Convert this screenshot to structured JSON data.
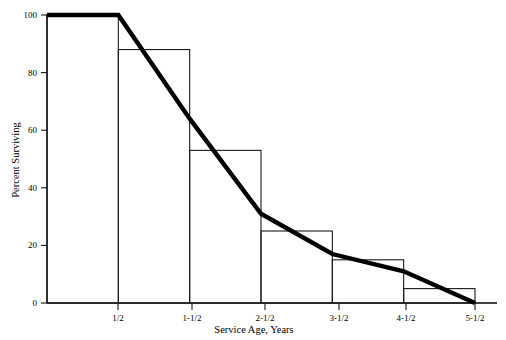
{
  "chart_data": {
    "type": "bar",
    "title": "",
    "subtitle": "",
    "xlabel": "Service Age, Years",
    "ylabel": "Percent Surviving",
    "categories": [
      "1/2",
      "1-1/2",
      "2-1/2",
      "3-1/2",
      "4-1/2",
      "5-1/2"
    ],
    "bar_intervals": [
      {
        "from": "0",
        "to": "1/2",
        "value": 100
      },
      {
        "from": "1/2",
        "to": "1-1/2",
        "value": 88
      },
      {
        "from": "1-1/2",
        "to": "2-1/2",
        "value": 53
      },
      {
        "from": "2-1/2",
        "to": "3-1/2",
        "value": 25
      },
      {
        "from": "3-1/2",
        "to": "4-1/2",
        "value": 15
      },
      {
        "from": "4-1/2",
        "to": "5-1/2",
        "value": 5
      }
    ],
    "values": [
      100,
      88,
      53,
      25,
      15,
      5
    ],
    "series": [
      {
        "name": "Histogram of survivors",
        "type": "bar",
        "values": [
          100,
          88,
          53,
          25,
          15,
          5
        ]
      },
      {
        "name": "Smoothed survival curve",
        "type": "line",
        "x": [
          "0",
          "1/2",
          "1-1/2",
          "2-1/2",
          "3-1/2",
          "4-1/2",
          "5-1/2"
        ],
        "values": [
          100,
          100,
          64,
          31,
          17,
          11,
          0
        ]
      }
    ],
    "xlim": [
      0,
      6
    ],
    "ylim": [
      0,
      100
    ],
    "xticks": [
      "1/2",
      "1-1/2",
      "2-1/2",
      "3-1/2",
      "4-1/2",
      "5-1/2"
    ],
    "yticks": [
      0,
      20,
      40,
      60,
      80,
      100
    ],
    "grid": false,
    "legend": "none"
  },
  "axes": {
    "y_title": "Percent Surviving",
    "x_title": "Service Age, Years",
    "y_tick_0": "0",
    "y_tick_20": "20",
    "y_tick_40": "40",
    "y_tick_60": "60",
    "y_tick_80": "80",
    "y_tick_100": "100",
    "x_tick_1": "1/2",
    "x_tick_2": "1-1/2",
    "x_tick_3": "2-1/2",
    "x_tick_4": "3-1/2",
    "x_tick_5": "4-1/2",
    "x_tick_6": "5-1/2"
  },
  "colors": {
    "ink": "#000000",
    "bar_outline": "#1a1a1a",
    "curve": "#000000",
    "background": "#ffffff"
  }
}
